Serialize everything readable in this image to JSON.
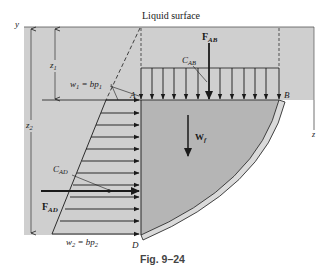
{
  "figure": {
    "caption": "Fig. 9–24",
    "title_label": "Liquid surface",
    "colors": {
      "liquid_fill": "#cfcfcf",
      "fluid_body_fill": "#b8b8b8",
      "gate_fill": "#d6d6d6",
      "ink": "#1a1a1a",
      "background": "#ffffff"
    },
    "axes": {
      "y_label": "y",
      "z_label": "z"
    },
    "dimensions": {
      "z1_label": "z",
      "z1_sub": "1",
      "z2_label": "z",
      "z2_sub": "2"
    },
    "loads": {
      "w1_main": "w",
      "w1_sub": "1",
      "w1_eq": " = bp",
      "w1_eq_sub": "1",
      "w2_main": "w",
      "w2_sub": "2",
      "w2_eq": " = bp",
      "w2_eq_sub": "2"
    },
    "forces": {
      "F_AB_main": "F",
      "F_AB_sub": "AB",
      "F_AD_main": "F",
      "F_AD_sub": "AD",
      "W_f_main": "W",
      "W_f_sub": "f"
    },
    "centroids": {
      "C_AB_main": "C",
      "C_AB_sub": "AB",
      "C_AD_main": "C",
      "C_AD_sub": "AD"
    },
    "points": {
      "A": "A",
      "B": "B",
      "D": "D"
    }
  }
}
